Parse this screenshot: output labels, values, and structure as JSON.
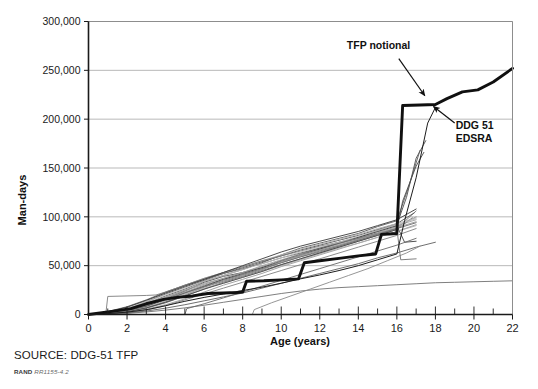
{
  "figure": {
    "source_note": "SOURCE: DDG-51 TFP",
    "rand_prefix": "RAND",
    "rand_id": "RR1155-4.2"
  },
  "chart_data": {
    "type": "line",
    "title": "",
    "xlabel": "Age (years)",
    "ylabel": "Man-days",
    "xlim": [
      0,
      22
    ],
    "ylim": [
      0,
      300000
    ],
    "grid": "horizontal",
    "legend": "none",
    "x_ticks": [
      0,
      2,
      4,
      6,
      8,
      10,
      12,
      14,
      16,
      18,
      20,
      22
    ],
    "x_tick_labels": [
      "0",
      "2",
      "4",
      "6",
      "8",
      "10",
      "12",
      "14",
      "16",
      "18",
      "20",
      "22"
    ],
    "x_minor_tick_interval": 1,
    "y_ticks": [
      0,
      50000,
      100000,
      150000,
      200000,
      250000,
      300000
    ],
    "y_tick_labels": [
      "0",
      "50,000",
      "100,000",
      "150,000",
      "200,000",
      "250,000",
      "300,000"
    ],
    "annotations": [
      {
        "name": "tfp-notional",
        "text": "TFP notional",
        "text_x": 15.05,
        "text_y": 272000,
        "arrow_from_x": 16.1,
        "arrow_from_y": 262000,
        "arrow_to_x": 17.45,
        "arrow_to_y": 224000
      },
      {
        "name": "ddg-51-edsra",
        "line1": "DDG 51",
        "line2": "EDSRA",
        "text_x": 19.05,
        "text_y": 190000,
        "arrow_from_x": 19.0,
        "arrow_from_y": 196000,
        "arrow_to_x": 17.9,
        "arrow_to_y": 213000
      }
    ],
    "series": [
      {
        "name": "TFP notional",
        "emphasis": "bold",
        "color": "#101010",
        "x": [
          0,
          0.6,
          1.5,
          2.2,
          3.0,
          3.9,
          4.6,
          5.4,
          6.2,
          7.0,
          7.7,
          8.0,
          8.2,
          9.1,
          10.0,
          10.9,
          11.2,
          12.0,
          13.0,
          14.0,
          14.9,
          15.2,
          15.6,
          16.0,
          16.3,
          17.2,
          18.0,
          18.6,
          19.4,
          20.2,
          21.0,
          22.0
        ],
        "y": [
          0,
          1500,
          4000,
          6000,
          11000,
          15500,
          17500,
          19000,
          21500,
          22000,
          22500,
          23000,
          34000,
          34500,
          35500,
          36500,
          53000,
          55000,
          57500,
          60000,
          62000,
          82000,
          82500,
          83000,
          214000,
          214500,
          215000,
          221000,
          228000,
          230000,
          238000,
          252000
        ]
      },
      {
        "name": "DDG 51 EDSRA",
        "emphasis": "thin-dark",
        "color": "#1d1d1d",
        "x": [
          0,
          1.0,
          2.0,
          3.1,
          4.0,
          5.0,
          6.0,
          7.0,
          8.0,
          9.0,
          10.0,
          11.0,
          12.0,
          13.0,
          14.0,
          15.0,
          16.0,
          16.4,
          17.0,
          17.6,
          18.0
        ],
        "y": [
          0,
          900,
          2400,
          5200,
          9000,
          13500,
          17500,
          21000,
          24500,
          28000,
          32000,
          36500,
          40500,
          45000,
          50000,
          56000,
          62000,
          96000,
          140000,
          196000,
          212000
        ]
      },
      {
        "name": "ship-01",
        "emphasis": "thin",
        "color": "#4d4d4d",
        "x": [
          0,
          1,
          2,
          3,
          4,
          5,
          6,
          7,
          8,
          9,
          10,
          11,
          12,
          13,
          14,
          15,
          16,
          16.5,
          17,
          17.5
        ],
        "y": [
          0,
          1200,
          3500,
          8000,
          16000,
          24000,
          33000,
          39000,
          43000,
          48000,
          55000,
          62000,
          68000,
          74000,
          79000,
          86000,
          92000,
          120000,
          160000,
          178000
        ]
      },
      {
        "name": "ship-02",
        "emphasis": "thin",
        "color": "#5a5a5a",
        "x": [
          0,
          1,
          2,
          3,
          4,
          5,
          6,
          7,
          8,
          9,
          10,
          11,
          12,
          13,
          14,
          15,
          16,
          16.6,
          17.2
        ],
        "y": [
          0,
          2000,
          5000,
          11000,
          19000,
          26000,
          34000,
          40000,
          46000,
          53000,
          61000,
          68000,
          73000,
          78000,
          83000,
          90000,
          96000,
          130000,
          168000
        ]
      },
      {
        "name": "ship-03",
        "emphasis": "thin",
        "color": "#7a7a7a",
        "x": [
          0,
          1,
          2,
          3,
          4,
          5,
          6,
          7,
          8,
          9,
          10,
          11,
          12,
          13,
          14,
          15,
          16,
          17
        ],
        "y": [
          0,
          800,
          2600,
          7000,
          13000,
          20000,
          28000,
          34000,
          40000,
          46000,
          53000,
          59000,
          64000,
          70000,
          76000,
          82000,
          88000,
          106000
        ]
      },
      {
        "name": "ship-04",
        "emphasis": "thin",
        "color": "#8e8e8e",
        "x": [
          0,
          1,
          2,
          3,
          4,
          5,
          6,
          7,
          8,
          9,
          10,
          11,
          12,
          13,
          14,
          15,
          16,
          17
        ],
        "y": [
          0,
          1500,
          4200,
          9500,
          17000,
          23000,
          30000,
          36000,
          41000,
          47000,
          54000,
          60000,
          66000,
          71000,
          77000,
          84000,
          90000,
          100000
        ]
      },
      {
        "name": "ship-05",
        "emphasis": "thin",
        "color": "#a2a2a2",
        "x": [
          0,
          1,
          2,
          3,
          4,
          5,
          6,
          7,
          8,
          9,
          10,
          11,
          12,
          13,
          14,
          15,
          16,
          17
        ],
        "y": [
          0,
          2200,
          6000,
          12000,
          18000,
          25000,
          32000,
          37000,
          43000,
          50000,
          56000,
          62000,
          67000,
          72000,
          78000,
          85000,
          91000,
          97000
        ]
      },
      {
        "name": "ship-06",
        "emphasis": "thin",
        "color": "#6a6a6a",
        "x": [
          0,
          1,
          2,
          3,
          4,
          5,
          6,
          7,
          8,
          9,
          10,
          11,
          12,
          13,
          14,
          15,
          16,
          16.8
        ],
        "y": [
          0,
          1000,
          3000,
          6500,
          12000,
          19000,
          26000,
          33000,
          39000,
          45000,
          51000,
          57000,
          63000,
          69000,
          75000,
          81000,
          87000,
          99000
        ]
      },
      {
        "name": "ship-07",
        "emphasis": "thin",
        "color": "#555555",
        "x": [
          0,
          1,
          2,
          3,
          4,
          5,
          6,
          7,
          8,
          9,
          10,
          11,
          12,
          13,
          14,
          15,
          16,
          16.9
        ],
        "y": [
          0,
          1800,
          5500,
          13000,
          21000,
          28000,
          35000,
          42000,
          48000,
          54000,
          60000,
          66000,
          71000,
          76000,
          81000,
          87000,
          93000,
          104000
        ]
      },
      {
        "name": "ship-08",
        "emphasis": "thin",
        "color": "#9a9a9a",
        "x": [
          0,
          1,
          2,
          3,
          4,
          5,
          6,
          7,
          8,
          9,
          10,
          11,
          12,
          13,
          14,
          15,
          16,
          17
        ],
        "y": [
          0,
          700,
          2200,
          5500,
          10000,
          16000,
          23000,
          30000,
          36000,
          42000,
          49000,
          55000,
          61000,
          67000,
          73000,
          79000,
          85000,
          92000
        ]
      },
      {
        "name": "ship-09",
        "emphasis": "thin",
        "color": "#b2b2b2",
        "x": [
          0,
          1,
          2,
          3,
          4,
          5,
          6,
          7,
          8,
          9,
          10,
          11,
          12,
          13,
          14,
          15,
          16,
          17
        ],
        "y": [
          0,
          2500,
          7000,
          14000,
          22000,
          30000,
          37000,
          43000,
          49000,
          55000,
          61000,
          67000,
          72000,
          77000,
          82000,
          88000,
          93000,
          99000
        ]
      },
      {
        "name": "ship-10",
        "emphasis": "thin",
        "color": "#3f3f3f",
        "x": [
          0,
          1,
          2,
          3,
          4,
          5,
          6,
          7,
          8,
          9,
          10,
          11,
          12,
          13,
          14,
          15,
          16,
          16.4,
          17
        ],
        "y": [
          0,
          1300,
          3800,
          8500,
          15000,
          22000,
          29000,
          36000,
          42000,
          48000,
          55000,
          61000,
          67000,
          73000,
          79000,
          85000,
          91000,
          74000,
          75000
        ]
      },
      {
        "name": "ship-11",
        "emphasis": "thin",
        "color": "#808080",
        "x": [
          0,
          1,
          2,
          3,
          4,
          5,
          6,
          7,
          8,
          9,
          10,
          11,
          12,
          13,
          14,
          15,
          16,
          17
        ],
        "y": [
          0,
          600,
          1800,
          4500,
          9000,
          15000,
          21000,
          27000,
          33000,
          39000,
          45000,
          51000,
          57000,
          63000,
          69000,
          75000,
          81000,
          88000
        ]
      },
      {
        "name": "ship-12",
        "emphasis": "thin",
        "color": "#666666",
        "x": [
          0,
          1,
          2,
          3,
          4,
          5,
          6,
          7,
          8,
          9,
          10,
          11,
          12,
          13,
          14,
          15,
          16,
          17
        ],
        "y": [
          0,
          3000,
          8000,
          15000,
          23000,
          30000,
          36000,
          42000,
          47000,
          52000,
          58000,
          63000,
          68000,
          73000,
          78000,
          83000,
          88000,
          94000
        ]
      },
      {
        "name": "ship-13",
        "emphasis": "thin",
        "color": "#ababab",
        "x": [
          0,
          1,
          2,
          3,
          4,
          5,
          6,
          7,
          8,
          9,
          10,
          11,
          12,
          13,
          14,
          15,
          16,
          17
        ],
        "y": [
          0,
          1100,
          3200,
          7500,
          14000,
          21000,
          27000,
          32000,
          38000,
          44000,
          50000,
          56000,
          62000,
          68000,
          73000,
          79000,
          85000,
          91000
        ]
      },
      {
        "name": "ship-14-low",
        "emphasis": "thin",
        "color": "#5f5f5f",
        "x": [
          0,
          1,
          2,
          3,
          4,
          5,
          6,
          7,
          8,
          9,
          10,
          11,
          12,
          13,
          14,
          15,
          16,
          17,
          18
        ],
        "y": [
          0,
          500,
          1500,
          3500,
          6500,
          10000,
          14000,
          18000,
          22000,
          27000,
          32000,
          37000,
          42000,
          47000,
          52000,
          58000,
          63000,
          69000,
          74000
        ]
      },
      {
        "name": "ship-15-lowflat",
        "emphasis": "thin",
        "color": "#707070",
        "x": [
          0,
          1,
          2,
          3,
          4,
          5,
          6,
          7,
          8,
          9,
          10,
          11,
          12,
          13,
          14,
          15,
          16,
          17,
          18,
          19,
          20,
          21,
          22
        ],
        "y": [
          0,
          400,
          1200,
          2600,
          4500,
          6800,
          9500,
          12500,
          15500,
          18500,
          21500,
          24000,
          26000,
          27500,
          28500,
          29500,
          30500,
          31500,
          32500,
          33000,
          33500,
          34000,
          34500
        ]
      },
      {
        "name": "ship-16-plateau",
        "emphasis": "thin",
        "color": "#7d7d7d",
        "x": [
          0,
          0.9,
          1.0,
          2.0,
          3.0,
          3.5,
          4.0,
          5.0,
          6.0,
          7.0,
          8.0,
          9.0,
          10.0,
          11.0,
          12.0,
          13.0,
          14.0,
          15.0,
          16.0
        ],
        "y": [
          0,
          1000,
          18500,
          19000,
          19500,
          20000,
          23000,
          30000,
          37000,
          43000,
          49000,
          55000,
          60000,
          65000,
          70000,
          74000,
          78000,
          83000,
          88000
        ]
      },
      {
        "name": "ship-17-late",
        "emphasis": "thin",
        "color": "#686868",
        "x": [
          5.0,
          5.1,
          6.0,
          7.0,
          8.0,
          9.0,
          10.0,
          11.0,
          12.0,
          13.0,
          14.0,
          15.0,
          16.0,
          17.0
        ],
        "y": [
          0,
          6000,
          11000,
          17000,
          23000,
          29000,
          35000,
          41000,
          47000,
          53000,
          59000,
          65000,
          71000,
          78000
        ]
      },
      {
        "name": "ship-18-late2",
        "emphasis": "thin",
        "color": "#8a8a8a",
        "x": [
          8.5,
          8.6,
          9.5,
          10.5,
          11.5,
          12.5,
          13.5,
          14.5,
          15.5,
          16.5,
          17.2
        ],
        "y": [
          0,
          5000,
          12000,
          19000,
          26000,
          33000,
          40000,
          47000,
          55000,
          63000,
          70000
        ]
      },
      {
        "name": "ship-19-stepbig",
        "emphasis": "thin",
        "color": "#4a4a4a",
        "x": [
          0,
          1,
          2,
          3,
          4,
          5,
          6,
          7,
          8,
          9,
          10,
          11,
          12,
          13,
          14,
          15,
          16,
          16.3,
          17,
          17.4
        ],
        "y": [
          0,
          900,
          2800,
          6800,
          12500,
          19000,
          26000,
          32000,
          38000,
          44000,
          51000,
          57000,
          63000,
          69000,
          75000,
          81000,
          87000,
          116000,
          152000,
          166000
        ]
      },
      {
        "name": "ship-20-highmid",
        "emphasis": "thin",
        "color": "#3a3a3a",
        "x": [
          0,
          1,
          2,
          3,
          4,
          5,
          6,
          7,
          8,
          9,
          10,
          11,
          12,
          13,
          14,
          15,
          16,
          17
        ],
        "y": [
          0,
          2800,
          7500,
          14500,
          22000,
          29000,
          36000,
          43000,
          50000,
          57000,
          64000,
          70000,
          75000,
          80000,
          85000,
          91000,
          97000,
          108000
        ]
      },
      {
        "name": "ship-21",
        "emphasis": "thin",
        "color": "#969696",
        "x": [
          0,
          1,
          2,
          3,
          4,
          5,
          6,
          7,
          8,
          9,
          10,
          11,
          12,
          13,
          14,
          15,
          16,
          17
        ],
        "y": [
          0,
          1600,
          4800,
          10500,
          17500,
          24500,
          31000,
          37000,
          43000,
          49000,
          55000,
          61000,
          66000,
          71000,
          77000,
          83000,
          89000,
          95000
        ]
      },
      {
        "name": "ship-22",
        "emphasis": "thin",
        "color": "#bcbcbc",
        "x": [
          0,
          1,
          2,
          3,
          4,
          5,
          6,
          7,
          8,
          9,
          10,
          11,
          12,
          13,
          14,
          15,
          16,
          17
        ],
        "y": [
          0,
          2000,
          6200,
          13000,
          20000,
          27000,
          34000,
          40000,
          46000,
          52000,
          58000,
          64000,
          69000,
          74000,
          80000,
          86000,
          92000,
          98000
        ]
      },
      {
        "name": "ship-23-dip",
        "emphasis": "thin",
        "color": "#727272",
        "x": [
          0,
          1,
          2,
          3,
          4,
          5,
          6,
          7,
          8,
          9,
          10,
          11,
          12,
          13,
          14,
          15,
          16,
          16.2,
          17
        ],
        "y": [
          0,
          1400,
          4000,
          9000,
          15500,
          22000,
          28500,
          35000,
          41000,
          47000,
          53000,
          59000,
          65000,
          70000,
          76000,
          82000,
          88000,
          56000,
          57000
        ]
      }
    ]
  }
}
